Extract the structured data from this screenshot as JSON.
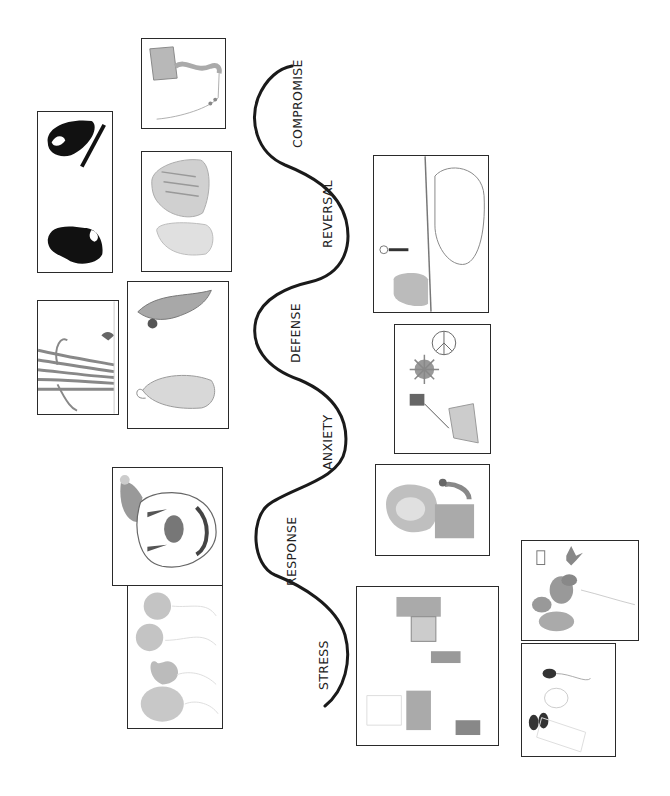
{
  "diagram": {
    "type": "stress-response-wave",
    "orientation": "rotated-90-ccw",
    "curve_color": "#1a1a1a",
    "stages": [
      {
        "id": "stress",
        "label": "STRESS"
      },
      {
        "id": "response",
        "label": "RESPONSE"
      },
      {
        "id": "anxiety",
        "label": "ANXIETY"
      },
      {
        "id": "defense",
        "label": "DEFENSE"
      },
      {
        "id": "reversal",
        "label": "REVERSAL"
      },
      {
        "id": "compromise",
        "label": "COMPROMISE"
      }
    ],
    "drawings": [
      {
        "id": "kite",
        "depicts": "kite on string",
        "side": "left"
      },
      {
        "id": "black-shapes",
        "depicts": "two black silhouette shapes",
        "side": "left"
      },
      {
        "id": "tiger-figure",
        "depicts": "tiger and figure pencil drawing",
        "side": "left"
      },
      {
        "id": "tree",
        "depicts": "large tree with small figure",
        "side": "left"
      },
      {
        "id": "dragon-rabbit",
        "depicts": "dragon and rabbit",
        "side": "left"
      },
      {
        "id": "clown",
        "depicts": "clown face",
        "side": "left"
      },
      {
        "id": "balloons",
        "depicts": "four balloons",
        "side": "left"
      },
      {
        "id": "elephant",
        "depicts": "elephant, stick figure and stump",
        "side": "right"
      },
      {
        "id": "peace",
        "depicts": "peace sign, sun and house on strings",
        "side": "right"
      },
      {
        "id": "girl",
        "depicts": "girl with long hair",
        "side": "right"
      },
      {
        "id": "room",
        "depicts": "room scene with furniture and figures",
        "side": "right"
      },
      {
        "id": "instruments",
        "depicts": "musical instruments and hearts",
        "side": "right"
      },
      {
        "id": "sketch",
        "depicts": "light sketch with dark shapes",
        "side": "right"
      }
    ]
  }
}
